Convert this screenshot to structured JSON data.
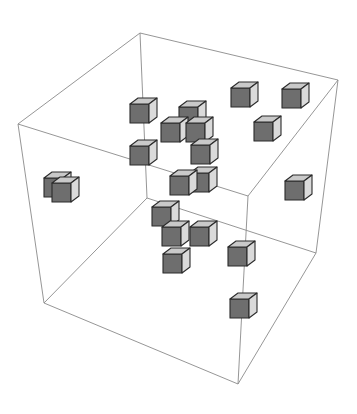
{
  "figure": {
    "colors": {
      "background": "#ffffff",
      "frame_edge": "#8a8a8a",
      "cube_top": "#c9c9c9",
      "cube_front": "#6e6e6e",
      "cube_side": "#dadada",
      "cube_outline": "#2b2b2b"
    },
    "frame": {
      "corners": {
        "top_back": [
          140,
          33
        ],
        "top_right": [
          338,
          80
        ],
        "top_left": [
          18,
          124
        ],
        "top_front": [
          248,
          196
        ],
        "bottom_back": [
          147,
          198
        ],
        "bottom_right": [
          316,
          253
        ],
        "bottom_left": [
          44,
          303
        ],
        "bottom_front": [
          238,
          384
        ]
      },
      "edges": [
        [
          "top_back",
          "top_right"
        ],
        [
          "top_back",
          "top_left"
        ],
        [
          "top_right",
          "top_front"
        ],
        [
          "top_left",
          "top_front"
        ],
        [
          "bottom_back",
          "bottom_right"
        ],
        [
          "bottom_back",
          "bottom_left"
        ],
        [
          "bottom_right",
          "bottom_front"
        ],
        [
          "bottom_left",
          "bottom_front"
        ],
        [
          "top_back",
          "bottom_back"
        ],
        [
          "top_right",
          "bottom_right"
        ],
        [
          "top_left",
          "bottom_left"
        ],
        [
          "top_front",
          "bottom_front"
        ]
      ]
    },
    "cubes": [
      {
        "x": 130,
        "y": 98
      },
      {
        "x": 179,
        "y": 101
      },
      {
        "x": 231,
        "y": 82
      },
      {
        "x": 282,
        "y": 83
      },
      {
        "x": 161,
        "y": 117
      },
      {
        "x": 186,
        "y": 117
      },
      {
        "x": 254,
        "y": 116
      },
      {
        "x": 130,
        "y": 140
      },
      {
        "x": 191,
        "y": 139
      },
      {
        "x": 170,
        "y": 170
      },
      {
        "x": 190,
        "y": 167
      },
      {
        "x": 285,
        "y": 175
      },
      {
        "x": 52,
        "y": 177
      },
      {
        "x": 44,
        "y": 172
      },
      {
        "x": 152,
        "y": 201
      },
      {
        "x": 162,
        "y": 221
      },
      {
        "x": 190,
        "y": 221
      },
      {
        "x": 228,
        "y": 241
      },
      {
        "x": 163,
        "y": 248
      },
      {
        "x": 230,
        "y": 293
      }
    ]
  }
}
